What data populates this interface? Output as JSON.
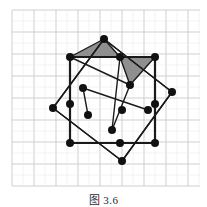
{
  "figure": {
    "caption": "图 3.6",
    "title": "图 3.6",
    "background_color": "#ffffff",
    "grid": {
      "visible": true,
      "line_color": "#c9c9c9",
      "minor_line_color": "#e4e4e4",
      "spacing_px": 22,
      "origin_x": 12,
      "origin_y": 10,
      "columns": 9,
      "rows": 9,
      "extent_x": [
        12,
        200
      ],
      "extent_y": [
        10,
        186
      ]
    },
    "stroke_color": "#1a1a1a",
    "stroke_width_outer": 2.2,
    "stroke_width_inner": 1.4,
    "vertex_dot": {
      "fill": "#111111",
      "radius": 4.0
    },
    "shading": {
      "fill": "#8f8f8f",
      "opacity": 1,
      "stroke": "#1a1a1a"
    },
    "shapes": {
      "upright_square": {
        "name": "upright-square",
        "points": [
          [
            70,
            57
          ],
          [
            155,
            57
          ],
          [
            155,
            143
          ],
          [
            70,
            143
          ]
        ]
      },
      "tilted_square": {
        "name": "tilted-square",
        "points": [
          [
            104,
            39
          ],
          [
            172,
            92
          ],
          [
            122,
            161
          ],
          [
            53,
            108
          ]
        ]
      },
      "inner_lattice_points": [
        [
          70,
          57
        ],
        [
          155,
          57
        ],
        [
          155,
          143
        ],
        [
          70,
          143
        ],
        [
          104,
          39
        ],
        [
          172,
          92
        ],
        [
          122,
          161
        ],
        [
          53,
          108
        ],
        [
          120,
          57
        ],
        [
          83,
          88
        ],
        [
          130,
          85
        ],
        [
          112,
          130
        ],
        [
          148,
          110
        ],
        [
          88,
          115
        ],
        [
          155,
          57
        ],
        [
          122,
          110
        ]
      ],
      "shaded_triangles": [
        {
          "name": "left-shaded-triangle",
          "points": [
            [
              70,
              57
            ],
            [
              104,
              39
            ],
            [
              120,
              57
            ]
          ]
        },
        {
          "name": "right-shaded-triangle",
          "points": [
            [
              120,
              57
            ],
            [
              155,
              57
            ],
            [
              130,
              85
            ]
          ]
        }
      ],
      "inner_segments": [
        [
          [
            104,
            39
          ],
          [
            53,
            108
          ]
        ],
        [
          [
            104,
            39
          ],
          [
            172,
            92
          ]
        ],
        [
          [
            172,
            92
          ],
          [
            122,
            161
          ]
        ],
        [
          [
            53,
            108
          ],
          [
            122,
            161
          ]
        ],
        [
          [
            70,
            57
          ],
          [
            130,
            85
          ]
        ],
        [
          [
            130,
            85
          ],
          [
            112,
            130
          ]
        ],
        [
          [
            83,
            88
          ],
          [
            148,
            110
          ]
        ],
        [
          [
            120,
            57
          ],
          [
            112,
            130
          ]
        ],
        [
          [
            83,
            88
          ],
          [
            88,
            115
          ]
        ]
      ],
      "vertex_dots": [
        {
          "name": "vertex-top-apex",
          "x": 104,
          "y": 39
        },
        {
          "name": "vertex-square-top-left",
          "x": 70,
          "y": 57
        },
        {
          "name": "vertex-square-top-mid",
          "x": 120,
          "y": 57
        },
        {
          "name": "vertex-square-top-right",
          "x": 155,
          "y": 57
        },
        {
          "name": "vertex-tilted-upper-right",
          "x": 130,
          "y": 85
        },
        {
          "name": "vertex-right-apex",
          "x": 172,
          "y": 92
        },
        {
          "name": "vertex-inner-upper-left",
          "x": 83,
          "y": 88
        },
        {
          "name": "vertex-left-apex",
          "x": 53,
          "y": 108
        },
        {
          "name": "vertex-square-left-mid",
          "x": 70,
          "y": 104
        },
        {
          "name": "vertex-inner-center",
          "x": 122,
          "y": 110
        },
        {
          "name": "vertex-right-mid",
          "x": 148,
          "y": 110
        },
        {
          "name": "vertex-square-right-mid",
          "x": 155,
          "y": 104
        },
        {
          "name": "vertex-inner-lower-left",
          "x": 88,
          "y": 115
        },
        {
          "name": "vertex-inner-lower",
          "x": 112,
          "y": 130
        },
        {
          "name": "vertex-square-bottom-left",
          "x": 70,
          "y": 143
        },
        {
          "name": "vertex-square-bottom-mid",
          "x": 120,
          "y": 143
        },
        {
          "name": "vertex-square-bottom-right",
          "x": 155,
          "y": 143
        },
        {
          "name": "vertex-bottom-apex",
          "x": 122,
          "y": 161
        }
      ]
    }
  }
}
